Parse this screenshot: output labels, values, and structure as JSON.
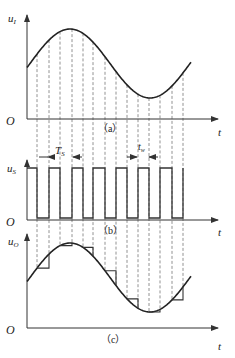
{
  "panels": {
    "a": {
      "caption": "（a）",
      "y_axis_label": "u",
      "y_axis_sub": "I",
      "origin_label": "O",
      "x_axis_label": "t",
      "curve": "sine input signal"
    },
    "b": {
      "caption": "（b）",
      "y_axis_label": "u",
      "y_axis_sub": "S",
      "origin_label": "O",
      "x_axis_label": "t",
      "period_label": "T",
      "period_sub": "S",
      "width_label": "t",
      "width_sub": "w",
      "curve": "sampling pulse train"
    },
    "c": {
      "caption": "（c）",
      "y_axis_label": "u",
      "y_axis_sub": "O",
      "origin_label": "O",
      "x_axis_label": "t",
      "curve": "sample-and-hold output"
    }
  },
  "geometry": {
    "origin_x": 27,
    "axis_end_x": 218,
    "curve_end_x": 191,
    "peak_x": 70,
    "half_period_px": 80,
    "amplitude": 34.5,
    "a": {
      "mid_y": 63.5,
      "axis_y": 119,
      "top_y": 15
    },
    "b": {
      "high_y": 168,
      "low_y": 218,
      "axis_y": 220,
      "top_y": 160
    },
    "c": {
      "mid_y": 277.5,
      "axis_y": 328,
      "top_y": 234
    },
    "sample_edges_x": [
      37,
      49,
      60,
      72,
      83,
      93,
      105,
      116,
      127,
      138,
      149,
      160,
      172,
      183
    ]
  },
  "colors": {
    "line": "#222222",
    "dash": "#777777",
    "background": "#ffffff"
  }
}
